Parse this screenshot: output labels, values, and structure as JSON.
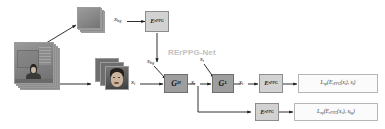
{
  "figure": {
    "net_label": "RErPPG-Net",
    "background": "#ffffff"
  },
  "colors": {
    "encoder_box": "#d2d2d2",
    "generator_box": "#9e9e9e",
    "loss_box": "#fbfbfb",
    "net_title": "#c2c2c2",
    "arrow": "#1a1a1a",
    "image_stack": "#8e8e8e"
  },
  "stacks": [
    {
      "id": "video-frames",
      "name": "input-video-frame-stack",
      "description": "stack of full grayscale video frames of a person in a room",
      "sheets": 4
    },
    {
      "id": "background-patches",
      "name": "background-patch-stack",
      "description": "stack of cropped background region patches",
      "sheets": 4
    },
    {
      "id": "face-crops",
      "name": "face-crop-stack",
      "description": "stack of cropped face region frames",
      "sheets": 3
    }
  ],
  "nodes": [
    {
      "id": "enc-bg",
      "name": "encoder-rppg-background",
      "type": "encoder",
      "label": "E",
      "sub": "rPPG"
    },
    {
      "id": "gen-h",
      "name": "generator-gh",
      "type": "generator",
      "label": "G",
      "sub": "H"
    },
    {
      "id": "gen-l",
      "name": "generator-gl",
      "type": "generator",
      "label": "G",
      "sub": "L"
    },
    {
      "id": "enc-top",
      "name": "encoder-rppg-top-branch",
      "type": "encoder",
      "label": "E",
      "sub": "rPPG"
    },
    {
      "id": "enc-bottom",
      "name": "encoder-rppg-bottom-branch",
      "type": "encoder",
      "label": "E",
      "sub": "rPPG"
    }
  ],
  "losses": [
    {
      "id": "loss-top",
      "name": "loss-np-target",
      "expr_prefix": "L",
      "expr_sub": "np",
      "expr_body": "(E",
      "expr_body_sub": "rPPG",
      "expr_tail": "(x",
      "expr_tail_sub": "t",
      "expr_end": "), s",
      "expr_end_sub": "t",
      "expr_close": ")",
      "full": "L_np(E_rPPG(x_t), s_t)"
    },
    {
      "id": "loss-bottom",
      "name": "loss-np-background",
      "expr_prefix": "L",
      "expr_sub": "np",
      "expr_body": "(E",
      "expr_body_sub": "rPPG",
      "expr_tail": "(x",
      "expr_tail_sub": "r",
      "expr_end": "), s",
      "expr_end_sub": "bg",
      "expr_close": ")",
      "full": "L_np(E_rPPG(x_r), s_bg)"
    }
  ],
  "labels": [
    {
      "id": "x-bg",
      "name": "label-x-bg",
      "base": "x",
      "sub": "bg"
    },
    {
      "id": "s-bg",
      "name": "label-s-bg",
      "base": "s",
      "sub": "bg"
    },
    {
      "id": "x-i",
      "name": "label-x-i",
      "base": "x",
      "sub": "i"
    },
    {
      "id": "x-r",
      "name": "label-x-r",
      "base": "x",
      "sub": "r"
    },
    {
      "id": "s-t",
      "name": "label-s-t",
      "base": "s",
      "sub": "t"
    },
    {
      "id": "x-t",
      "name": "label-x-t",
      "base": "x",
      "sub": "t"
    }
  ]
}
